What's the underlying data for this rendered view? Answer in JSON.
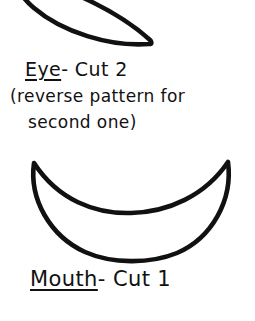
{
  "page": {
    "background_color": "#ffffff",
    "ink_color": "#111111",
    "width": 255,
    "height": 321,
    "kind": "hand-drawn craft pattern sheet"
  },
  "eye": {
    "shape_name": "eye-pattern-outline",
    "shape_type": "pointed oval / lens (leaf) shape, cropped at top edge",
    "label_underlined": "Eye",
    "label_rest": " - Cut 2",
    "note_line_1": "(reverse pattern for",
    "note_line_2": "second one)",
    "stroke_color": "#111111",
    "stroke_width": 4.5,
    "fill": "#ffffff"
  },
  "mouth": {
    "shape_name": "mouth-pattern-outline",
    "shape_type": "crescent / banana smile",
    "label_underlined": "Mouth",
    "label_rest": " - Cut 1",
    "stroke_color": "#111111",
    "stroke_width": 4.5,
    "fill": "#ffffff"
  }
}
